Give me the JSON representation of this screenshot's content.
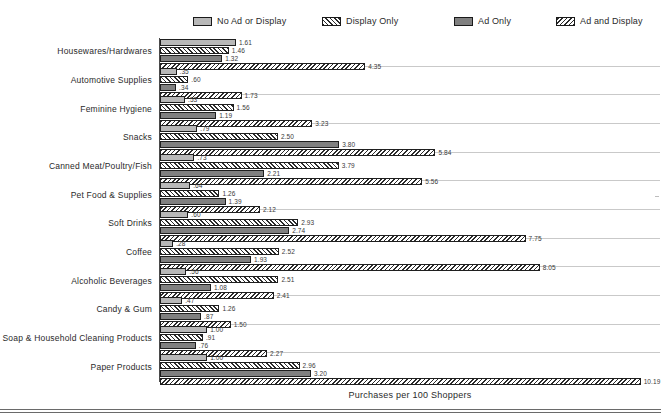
{
  "legend": {
    "items": [
      {
        "label": "No Ad or Display",
        "pattern": "solid-light-gray",
        "color": "#b8b8b8",
        "x": 193
      },
      {
        "label": "Display Only",
        "pattern": "diagonal-hatch-left",
        "color": "#2b2b2b",
        "x": 322
      },
      {
        "label": "Ad Only",
        "pattern": "solid-dark-gray",
        "color": "#808080",
        "x": 454
      },
      {
        "label": "Ad and Display",
        "pattern": "diagonal-hatch-right",
        "color": "#2b2b2b",
        "x": 556
      }
    ]
  },
  "axis": {
    "x_title": "Purchases per 100 Shoppers"
  },
  "chart_data": {
    "type": "bar",
    "orientation": "horizontal",
    "title": "",
    "xlabel": "Purchases per 100 Shoppers",
    "ylabel": "",
    "xlim": [
      0,
      10.6
    ],
    "grid": false,
    "legend_position": "top",
    "categories": [
      "Housewares/Hardwares",
      "Automotive Supplies",
      "Feminine Hygiene",
      "Snacks",
      "Canned Meat/Poultry/Fish",
      "Pet Food & Supplies",
      "Soft Drinks",
      "Coffee",
      "Alcoholic Beverages",
      "Candy & Gum",
      "Soap & Household Cleaning Products",
      "Paper Products"
    ],
    "series": [
      {
        "name": "No Ad or Display",
        "values": [
          1.61,
          0.35,
          0.53,
          0.79,
          0.73,
          0.64,
          0.6,
          0.28,
          0.56,
          0.47,
          1.0,
          1.0
        ],
        "labels": [
          "1.61",
          ".35",
          ".53",
          ".79",
          ".73",
          ".64",
          ".60",
          ".28",
          ".56",
          ".47",
          "1.00",
          "1.00"
        ]
      },
      {
        "name": "Display Only",
        "values": [
          1.46,
          0.6,
          1.56,
          2.5,
          3.79,
          1.26,
          2.93,
          2.52,
          2.51,
          1.26,
          0.91,
          2.96
        ],
        "labels": [
          "1.46",
          ".60",
          "1.56",
          "2.50",
          "3.79",
          "1.26",
          "2.93",
          "2.52",
          "2.51",
          "1.26",
          ".91",
          "2.96"
        ]
      },
      {
        "name": "Ad Only",
        "values": [
          1.32,
          0.34,
          1.19,
          3.8,
          2.21,
          1.39,
          2.74,
          1.93,
          1.08,
          0.87,
          0.76,
          3.2
        ],
        "labels": [
          "1.32",
          ".34",
          "1.19",
          "3.80",
          "2.21",
          "1.39",
          "2.74",
          "1.93",
          "1.08",
          ".87",
          ".76",
          "3.20"
        ]
      },
      {
        "name": "Ad and Display",
        "values": [
          4.35,
          1.73,
          3.23,
          5.84,
          5.56,
          2.12,
          7.75,
          8.05,
          2.41,
          1.5,
          2.27,
          10.19
        ],
        "labels": [
          "4.35",
          "1.73",
          "3.23",
          "5.84",
          "5.56",
          "2.12",
          "7.75",
          "8.05",
          "2.41",
          "1.50",
          "2.27",
          "10.19"
        ]
      }
    ]
  }
}
